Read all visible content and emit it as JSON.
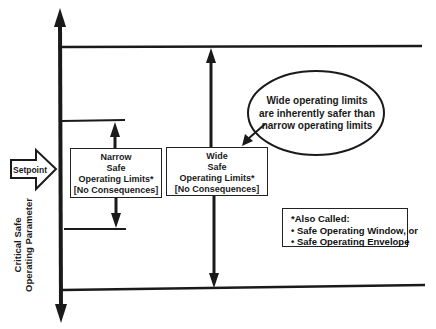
{
  "setpoint": {
    "label": "Setpoint"
  },
  "axis": {
    "label_line1": "Critical Safe",
    "label_line2": "Operating Parameter"
  },
  "narrow_box": {
    "line1": "Narrow",
    "line2": "Safe",
    "line3": "Operating Limits*",
    "line4": "[No Consequences]"
  },
  "wide_box": {
    "line1": "Wide",
    "line2": "Safe",
    "line3": "Operating Limits*",
    "line4": "[No Consequences]"
  },
  "callout": {
    "line1": "Wide operating limits",
    "line2": "are inherently safer than",
    "line3": "narrow operating limits"
  },
  "note": {
    "title": "*Also Called:",
    "items": [
      "• Safe Operating Window, or",
      "• Safe Operating Envelope"
    ]
  },
  "colors": {
    "ink": "#1a1a1a",
    "background": "#ffffff"
  }
}
